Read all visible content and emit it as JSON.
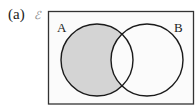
{
  "figure": {
    "part_label": "(a)",
    "universal_set_symbol": "ℰ",
    "sets": [
      {
        "name": "A",
        "cx": 97,
        "cy": 60,
        "r": 36
      },
      {
        "name": "B",
        "cx": 147,
        "cy": 60,
        "r": 36
      }
    ],
    "shaded_region": "A only (A ∩ B′)",
    "colors": {
      "shade": "#d4d4d4",
      "background": "#fbfbfb",
      "stroke": "#1a1a1a",
      "frame": "#333333"
    }
  }
}
